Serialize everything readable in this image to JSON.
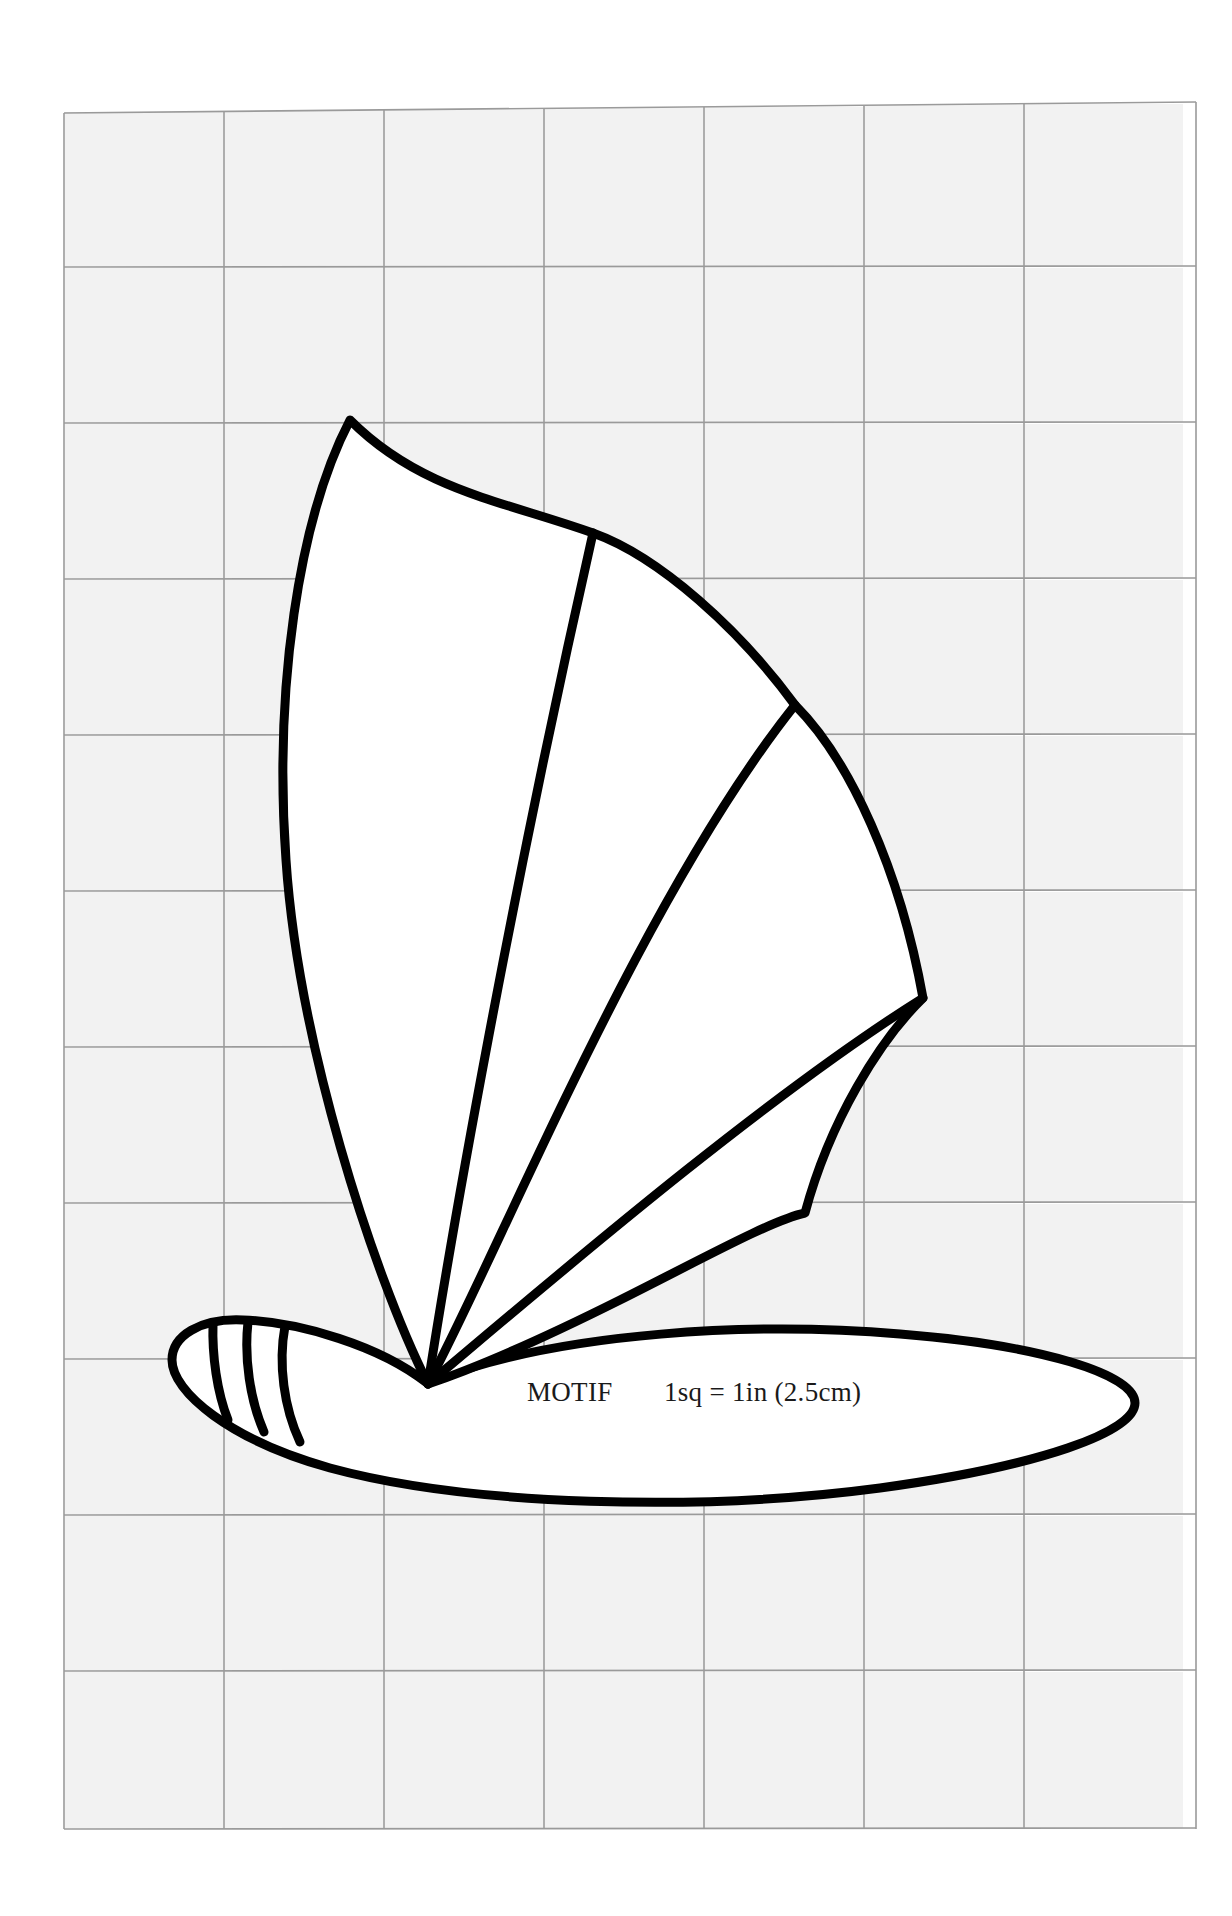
{
  "page": {
    "kind": "sewing-pattern-template-sheet",
    "background_color": "#ffffff",
    "width": 1232,
    "height": 1916
  },
  "grid": {
    "label": "scale-grid",
    "columns": 7,
    "rows": 11,
    "cell_size_px": 160,
    "cell_fill_color": "#f2f2f2",
    "line_color": "#9a9a9a",
    "origin_x": 64,
    "origin_y": 110
  },
  "caption": {
    "motif_label": "MOTIF",
    "scale_label": "1sq = 1in (2.5cm)",
    "text_color": "#1a1a1a"
  },
  "motif": {
    "name": "sailboat-motif",
    "description": "fan-shaped sail above an elongated hull",
    "outline_color": "#000000",
    "fill_color": "#ffffff",
    "stroke_width_px": 9,
    "parts": [
      {
        "name": "sail",
        "ribs": 3
      },
      {
        "name": "hull",
        "stripes": 3
      }
    ]
  }
}
